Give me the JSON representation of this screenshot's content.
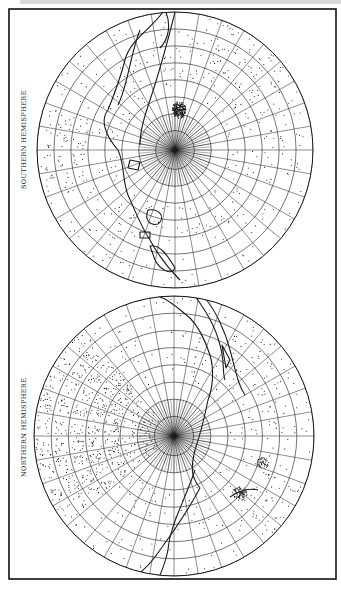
{
  "figure": {
    "colors": {
      "ink": "#1a1a1a",
      "paper": "#ffffff",
      "frame": "#111111"
    },
    "hemispheres": [
      {
        "id": "southern",
        "label": "SOUTHERN HEMISPHERE",
        "center": [
          175,
          150
        ],
        "radius": 138,
        "rings": 7,
        "spokes": 36,
        "label_pos": [
          24,
          188
        ]
      },
      {
        "id": "northern",
        "label": "NORTHERN HEMISPHERE",
        "center": [
          174,
          436
        ],
        "radius": 140,
        "rings": 7,
        "spokes": 36,
        "label_pos": [
          24,
          475
        ]
      }
    ]
  }
}
